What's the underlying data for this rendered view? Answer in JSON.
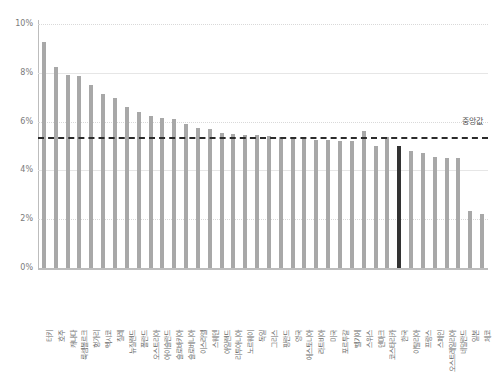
{
  "chart_data": {
    "type": "bar",
    "title": "",
    "subtitle": "",
    "xlabel": "",
    "ylabel": "",
    "ylim": [
      0,
      10
    ],
    "ytick_labels": [
      "0%",
      "2%",
      "4%",
      "6%",
      "8%",
      "10%"
    ],
    "ytick_values": [
      0,
      2,
      4,
      6,
      8,
      10
    ],
    "grid": true,
    "grid_axis": "y",
    "legend": "none",
    "value_unit": "%",
    "bar_color": "#a8a8a8",
    "highlight_color": "#333333",
    "highlight_category": "한국",
    "reference_line": {
      "name": "median",
      "label": "중앙값",
      "value": 5.35,
      "style": "dashed",
      "color": "#2b2b2b"
    },
    "categories": [
      "터키",
      "호주",
      "캐나다",
      "룩셈볼르크",
      "헝가리",
      "멕시코",
      "칠레",
      "뉴질랜드",
      "폴란드",
      "오스트리아",
      "아이슬란드",
      "슬로바키아",
      "슬로베니아",
      "이스라엘",
      "스웨덴",
      "아일랜드",
      "리투아니아",
      "노르웨이",
      "독일",
      "그리스",
      "핑란드",
      "영국",
      "에스토니아",
      "라트비아",
      "미국",
      "포르투갈",
      "벨기에",
      "스위스",
      "덴마크",
      "코스타리카",
      "한국",
      "이탈리아",
      "프랑스",
      "스페인",
      "오스트레일리아",
      "네덜란드",
      "일본",
      "체코"
    ],
    "values": [
      9.25,
      8.25,
      7.9,
      7.85,
      7.5,
      7.15,
      6.95,
      6.6,
      6.4,
      6.25,
      6.15,
      6.1,
      5.9,
      5.75,
      5.7,
      5.55,
      5.5,
      5.45,
      5.45,
      5.4,
      5.35,
      5.3,
      5.3,
      5.25,
      5.25,
      5.2,
      5.2,
      5.6,
      5.0,
      5.35,
      5.0,
      4.8,
      4.7,
      4.55,
      4.5,
      4.5,
      2.35,
      2.2
    ]
  }
}
